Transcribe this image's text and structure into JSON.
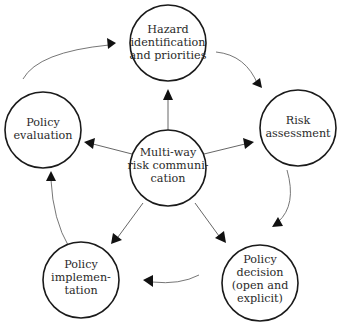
{
  "diagram": {
    "type": "cycle-with-hub",
    "hub": {
      "id": "multi-way",
      "lines": [
        "Multi-way",
        "risk communi-",
        "cation"
      ]
    },
    "nodes": [
      {
        "id": "hazard",
        "lines": [
          "Hazard",
          "identification",
          "and priorities"
        ]
      },
      {
        "id": "risk",
        "lines": [
          "Risk",
          "assessment"
        ]
      },
      {
        "id": "decision",
        "lines": [
          "Policy",
          "decision",
          "(open and",
          "explicit)"
        ]
      },
      {
        "id": "implementation",
        "lines": [
          "Policy",
          "implemen-",
          "tation"
        ]
      },
      {
        "id": "evaluation",
        "lines": [
          "Policy",
          "evaluation"
        ]
      }
    ],
    "cycle_order": [
      "hazard",
      "risk",
      "decision",
      "implementation",
      "evaluation",
      "hazard"
    ],
    "hub_arrows_to": [
      "hazard",
      "risk",
      "decision",
      "implementation",
      "evaluation"
    ],
    "colors": {
      "circle_stroke": "#1a1a1a",
      "arrow": "#111111",
      "text": "#2a2a2a",
      "background": "#ffffff"
    }
  }
}
